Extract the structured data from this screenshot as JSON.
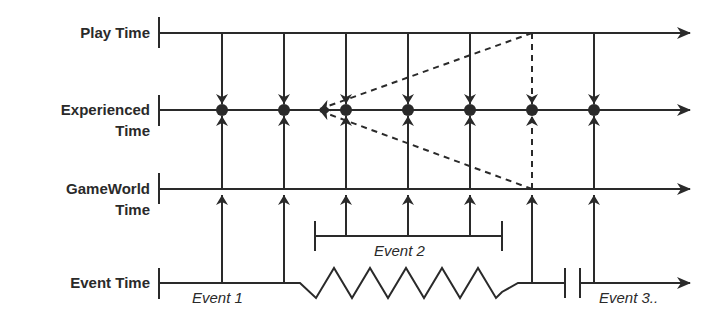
{
  "diagram": {
    "colors": {
      "line": "#2a2a2a",
      "background": "#ffffff"
    },
    "axes": [
      {
        "id": "play",
        "label_lines": [
          "Play Time"
        ],
        "y": 33
      },
      {
        "id": "experienced",
        "label_lines": [
          "Experienced",
          "Time"
        ],
        "y": 110
      },
      {
        "id": "gameworld",
        "label_lines": [
          "GameWorld",
          "Time"
        ],
        "y": 189
      },
      {
        "id": "event",
        "label_lines": [
          "Event Time"
        ],
        "y": 283
      }
    ],
    "labels": {
      "play": "Play Time",
      "experienced_1": "Experienced",
      "experienced_2": "Time",
      "gameworld_1": "GameWorld",
      "gameworld_2": "Time",
      "event": "Event Time"
    },
    "events": {
      "event1": "Event 1",
      "event2": "Event 2",
      "event3": "Event 3.."
    },
    "time_points_x": [
      222,
      284,
      346,
      408,
      470,
      532,
      594
    ],
    "dashed_point_x": 532,
    "rewind_target": {
      "x": 318,
      "y": 110
    }
  }
}
